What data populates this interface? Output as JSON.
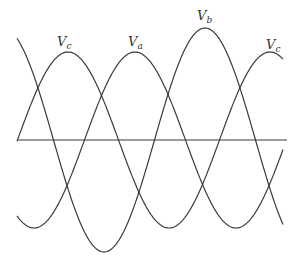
{
  "diagram": {
    "stroke_color": "#3a3a3a",
    "background": "#ffffff",
    "axis": {
      "x1": 17,
      "x2": 287,
      "y": 140
    },
    "x_range": [
      17,
      283
    ],
    "period_px": 202,
    "waves": [
      {
        "name": "Vc",
        "peak_x": 68,
        "amplitude_px": 88
      },
      {
        "name": "Va",
        "peak_x": 135,
        "amplitude_px": 88
      },
      {
        "name": "Vb",
        "peak_x": 205,
        "amplitude_px": 112
      }
    ],
    "labels": [
      {
        "id": "vc-left",
        "base": "V",
        "sub": "c",
        "x": 57,
        "y": 35
      },
      {
        "id": "va",
        "base": "V",
        "sub": "a",
        "x": 128,
        "y": 35
      },
      {
        "id": "vb",
        "base": "V",
        "sub": "b",
        "x": 197,
        "y": 9
      },
      {
        "id": "vc-right",
        "base": "V",
        "sub": "c",
        "x": 266,
        "y": 38
      }
    ]
  }
}
